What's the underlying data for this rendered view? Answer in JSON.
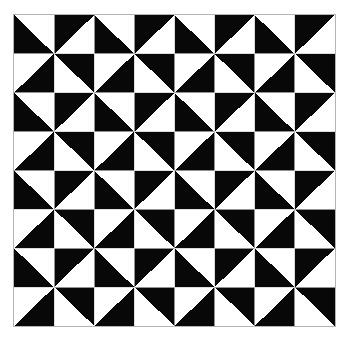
{
  "page": {
    "width": 344,
    "height": 340,
    "background_color": "#ffffff"
  },
  "artwork": {
    "name": "pinwheel-quilt-pattern",
    "description": "Monochrome geometric quilt block pattern of half-square triangles arranged as repeating pinwheels",
    "frame": {
      "x": 13,
      "y": 14,
      "width": 323,
      "height": 313,
      "border_color": "#b4b4b4",
      "border_width": 1
    },
    "colors": {
      "fill_dark": "#080808",
      "fill_light": "#ffffff",
      "gridline": "#cfcfcf"
    },
    "grid": {
      "columns": 8,
      "rows": 8,
      "cell_width": 40.375,
      "cell_height": 39.125,
      "gridlines_visible": true
    },
    "block": {
      "name": "pinwheel",
      "size_cells": 2,
      "repeats_x": 4,
      "repeats_y": 4,
      "cells": [
        [
          "bottom-left",
          "top-left"
        ],
        [
          "bottom-right",
          "top-right"
        ]
      ]
    },
    "legend": {
      "orientation_keys": [
        "top-left",
        "top-right",
        "bottom-left",
        "bottom-right"
      ],
      "orientation_note": "Names the corner of the square occupied by the black right triangle"
    }
  },
  "chart_data": {
    "type": "heatmap",
    "xlabel": "",
    "ylabel": "",
    "columns": 8,
    "rows": 8,
    "legend": [
      "black triangle corner: TL, TR, BL, BR"
    ],
    "grid": true,
    "cells": [
      [
        "bottom-left",
        "top-left",
        "bottom-left",
        "top-left",
        "bottom-left",
        "top-left",
        "bottom-left",
        "top-left"
      ],
      [
        "bottom-right",
        "top-right",
        "bottom-right",
        "top-right",
        "bottom-right",
        "top-right",
        "bottom-right",
        "top-right"
      ],
      [
        "bottom-left",
        "top-left",
        "bottom-left",
        "top-left",
        "bottom-left",
        "top-left",
        "bottom-left",
        "top-left"
      ],
      [
        "bottom-right",
        "top-right",
        "bottom-right",
        "top-right",
        "bottom-right",
        "top-right",
        "bottom-right",
        "top-right"
      ],
      [
        "bottom-left",
        "top-left",
        "bottom-left",
        "top-left",
        "bottom-left",
        "top-left",
        "bottom-left",
        "top-left"
      ],
      [
        "bottom-right",
        "top-right",
        "bottom-right",
        "top-right",
        "bottom-right",
        "top-right",
        "bottom-right",
        "top-right"
      ],
      [
        "bottom-left",
        "top-left",
        "bottom-left",
        "top-left",
        "bottom-left",
        "top-left",
        "bottom-left",
        "top-left"
      ],
      [
        "bottom-right",
        "top-right",
        "bottom-right",
        "top-right",
        "bottom-right",
        "top-right",
        "bottom-right",
        "top-right"
      ]
    ]
  }
}
